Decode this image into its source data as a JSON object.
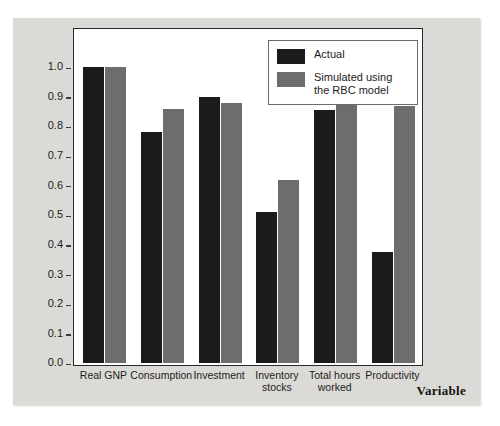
{
  "chart_data": {
    "type": "bar",
    "title": "",
    "xlabel": "Variable",
    "ylabel": "Correlation",
    "ylim": [
      0.0,
      1.0
    ],
    "yticks": [
      "0.0",
      "0.1",
      "0.2",
      "0.3",
      "0.4",
      "0.5",
      "0.6",
      "0.7",
      "0.8",
      "0.9",
      "1.0"
    ],
    "grid": false,
    "legend_position": "top-right",
    "categories": [
      "Real GNP",
      "Consumption",
      "Investment",
      "Inventory stocks",
      "Total hours worked",
      "Productivity"
    ],
    "category_lines": [
      [
        "Real GNP"
      ],
      [
        "Consumption"
      ],
      [
        "Investment"
      ],
      [
        "Inventory",
        "stocks"
      ],
      [
        "Total hours",
        "worked"
      ],
      [
        "Productivity"
      ]
    ],
    "series": [
      {
        "name": "Actual",
        "color": "#1b1b1b",
        "values": [
          1.0,
          0.78,
          0.9,
          0.51,
          0.855,
          0.375
        ]
      },
      {
        "name": "Simulated using the RBC model",
        "color": "#6d6d6d",
        "values": [
          1.0,
          0.86,
          0.88,
          0.62,
          0.95,
          0.87
        ]
      }
    ]
  },
  "legend": {
    "entries": [
      {
        "label": "Actual",
        "color": "#1b1b1b"
      },
      {
        "label": "Simulated using\nthe RBC model",
        "label_line1": "Simulated using",
        "label_line2": "the RBC model",
        "color": "#6d6d6d"
      }
    ]
  },
  "axes": {
    "y_title": "Correlation",
    "x_title": "Variable"
  },
  "colors": {
    "panel_background": "#dcdad6",
    "plot_background": "#ffffff",
    "axis": "#2a2a2a",
    "series_actual": "#1b1b1b",
    "series_simulated": "#6d6d6d"
  }
}
